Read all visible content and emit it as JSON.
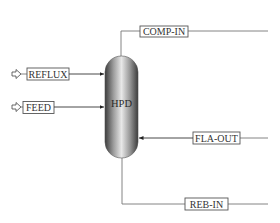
{
  "diagram": {
    "type": "process-flowsheet",
    "unit": {
      "id": "HPD",
      "label": "HPD",
      "shape": "vertical-vessel"
    },
    "streams": [
      {
        "id": "reflux",
        "label": "REFLUX",
        "direction": "feed-in",
        "side": "left",
        "icon": "feed-arrow-icon"
      },
      {
        "id": "feed",
        "label": "FEED",
        "direction": "feed-in",
        "side": "left",
        "icon": "feed-arrow-icon"
      },
      {
        "id": "comp-in",
        "label": "COMP-IN",
        "direction": "out",
        "side": "top"
      },
      {
        "id": "fla-out",
        "label": "FLA-OUT",
        "direction": "in",
        "side": "right"
      },
      {
        "id": "reb-in",
        "label": "REB-IN",
        "direction": "out",
        "side": "bottom"
      }
    ]
  },
  "colors": {
    "line": "#777777",
    "box_border": "#555555",
    "text": "#333333",
    "vessel_dark": "#4a4a4a",
    "vessel_light": "#e6e6e6"
  }
}
